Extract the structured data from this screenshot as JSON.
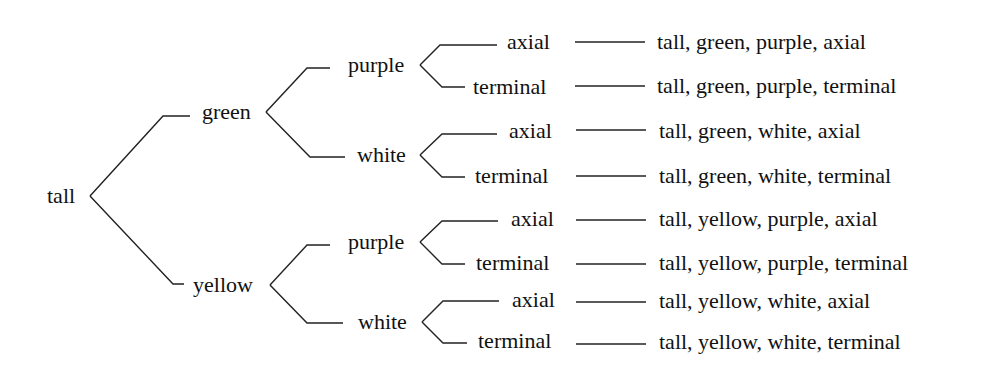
{
  "diagram": {
    "type": "tree",
    "root": "tall",
    "level1": [
      "green",
      "yellow"
    ],
    "level2": {
      "green": [
        "purple",
        "white"
      ],
      "yellow": [
        "purple",
        "white"
      ]
    },
    "level3": [
      "axial",
      "terminal"
    ],
    "nodes": {
      "root": "tall",
      "green": "green",
      "yellow": "yellow",
      "green_purple": "purple",
      "green_white": "white",
      "yellow_purple": "purple",
      "yellow_white": "white",
      "leaf1": "axial",
      "leaf2": "terminal",
      "leaf3": "axial",
      "leaf4": "terminal",
      "leaf5": "axial",
      "leaf6": "terminal",
      "leaf7": "axial",
      "leaf8": "terminal"
    },
    "outcomes": [
      "tall, green, purple, axial",
      "tall, green, purple, terminal",
      "tall, green, white, axial",
      "tall, green, white, terminal",
      "tall, yellow, purple, axial",
      "tall, yellow, purple, terminal",
      "tall, yellow, white, axial",
      "tall, yellow, white, terminal"
    ],
    "line_color": "#222222",
    "text_color": "#111111"
  }
}
